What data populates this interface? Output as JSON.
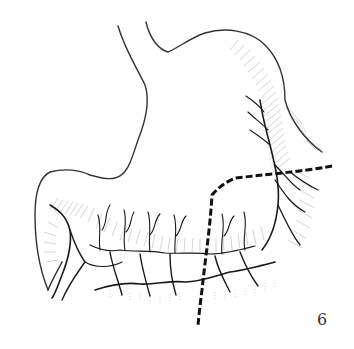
{
  "figure": {
    "number_label": "6",
    "colors": {
      "outline": "#333333",
      "vessels": "#1a1a1a",
      "hatching": "#9a9a9a",
      "dashed_line": "#111111",
      "background": "#ffffff"
    }
  }
}
